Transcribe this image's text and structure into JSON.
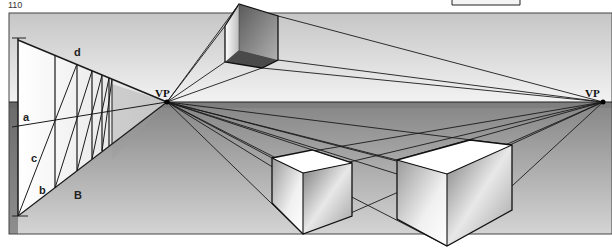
{
  "page": {
    "number": "110"
  },
  "figure": {
    "labels": {
      "vp_left": "VP",
      "vp_right": "VP",
      "a": "a",
      "b": "b",
      "c": "c",
      "d": "d",
      "B": "B"
    },
    "colors": {
      "sky_top": "#c8c8c8",
      "sky_bottom": "#f4f4f4",
      "ground_top": "#8a8a8a",
      "ground_bottom": "#d6d6d6",
      "horizon_band": "#6e6e6e",
      "line": "#1a1a1a",
      "box_top": "#ffffff",
      "box_dark": "#6a6a6a"
    },
    "vanishing_points": [
      {
        "name": "VP",
        "x": 167,
        "y": 102
      },
      {
        "name": "VP",
        "x": 603,
        "y": 102
      }
    ],
    "horizon_y": 102
  }
}
